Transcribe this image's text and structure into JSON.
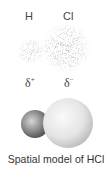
{
  "figure": {
    "atoms": [
      {
        "symbol": "H",
        "partial_charge": "δ",
        "charge_sign": "+"
      },
      {
        "symbol": "Cl",
        "partial_charge": "δ",
        "charge_sign": "−"
      }
    ],
    "electron_cloud_label": "electron density distribution",
    "caption": "Spatial model of HCl",
    "colors": {
      "cloud_dots": "#555555",
      "h_sphere": "#8a8a8a",
      "cl_sphere": "#e2e2e2",
      "text": "#333333"
    }
  }
}
